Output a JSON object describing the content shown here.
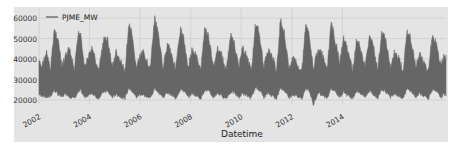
{
  "chart_data": {
    "type": "area",
    "title": "",
    "xlabel": "Datetime",
    "ylabel": "",
    "legend": {
      "position": "upper left",
      "entries": [
        "PJME_MW"
      ]
    },
    "grid": true,
    "ylim": [
      17000,
      62000
    ],
    "xlim": [
      2002.0,
      2018.1
    ],
    "yticks": [
      20000,
      30000,
      40000,
      50000,
      60000
    ],
    "ytick_labels": [
      "20000",
      "30000",
      "40000",
      "50000",
      "60000"
    ],
    "xticks": [
      2002,
      2004,
      2006,
      2008,
      2010,
      2012,
      2014
    ],
    "xtick_labels": [
      "2002",
      "2004",
      "2006",
      "2008",
      "2010",
      "2012",
      "2014"
    ],
    "series": [
      {
        "name": "PJME_MW",
        "color": "#666666",
        "baseline_min": 20000,
        "seasonal_points": [
          {
            "x": 2002.0,
            "max": 40000,
            "min": 22000
          },
          {
            "x": 2002.1,
            "max": 38000,
            "min": 21500
          },
          {
            "x": 2002.3,
            "max": 45000,
            "min": 20500
          },
          {
            "x": 2002.45,
            "max": 36000,
            "min": 21000
          },
          {
            "x": 2002.6,
            "max": 56000,
            "min": 24000
          },
          {
            "x": 2002.75,
            "max": 52000,
            "min": 22000
          },
          {
            "x": 2002.9,
            "max": 38000,
            "min": 20500
          },
          {
            "x": 2003.05,
            "max": 43000,
            "min": 22500
          },
          {
            "x": 2003.2,
            "max": 47000,
            "min": 21000
          },
          {
            "x": 2003.4,
            "max": 36000,
            "min": 20000
          },
          {
            "x": 2003.55,
            "max": 54000,
            "min": 23000
          },
          {
            "x": 2003.65,
            "max": 54500,
            "min": 24000
          },
          {
            "x": 2003.8,
            "max": 38000,
            "min": 20500
          },
          {
            "x": 2004.0,
            "max": 44000,
            "min": 22000
          },
          {
            "x": 2004.1,
            "max": 47000,
            "min": 22500
          },
          {
            "x": 2004.35,
            "max": 36000,
            "min": 20000
          },
          {
            "x": 2004.55,
            "max": 51000,
            "min": 23000
          },
          {
            "x": 2004.7,
            "max": 52000,
            "min": 23500
          },
          {
            "x": 2004.9,
            "max": 38000,
            "min": 20500
          },
          {
            "x": 2005.05,
            "max": 45000,
            "min": 22000
          },
          {
            "x": 2005.2,
            "max": 41000,
            "min": 21000
          },
          {
            "x": 2005.4,
            "max": 36000,
            "min": 20000
          },
          {
            "x": 2005.55,
            "max": 58000,
            "min": 25000
          },
          {
            "x": 2005.65,
            "max": 55000,
            "min": 24000
          },
          {
            "x": 2005.85,
            "max": 38000,
            "min": 20500
          },
          {
            "x": 2006.0,
            "max": 43000,
            "min": 22000
          },
          {
            "x": 2006.15,
            "max": 45000,
            "min": 21500
          },
          {
            "x": 2006.4,
            "max": 37000,
            "min": 20000
          },
          {
            "x": 2006.58,
            "max": 62000,
            "min": 25000
          },
          {
            "x": 2006.7,
            "max": 55000,
            "min": 23500
          },
          {
            "x": 2006.9,
            "max": 38000,
            "min": 20500
          },
          {
            "x": 2007.1,
            "max": 50000,
            "min": 23000
          },
          {
            "x": 2007.25,
            "max": 44000,
            "min": 21500
          },
          {
            "x": 2007.4,
            "max": 37000,
            "min": 20000
          },
          {
            "x": 2007.6,
            "max": 56000,
            "min": 24500
          },
          {
            "x": 2007.7,
            "max": 53000,
            "min": 24000
          },
          {
            "x": 2007.9,
            "max": 38000,
            "min": 20500
          },
          {
            "x": 2008.05,
            "max": 46000,
            "min": 22500
          },
          {
            "x": 2008.2,
            "max": 44000,
            "min": 21500
          },
          {
            "x": 2008.4,
            "max": 36000,
            "min": 20000
          },
          {
            "x": 2008.55,
            "max": 57000,
            "min": 24000
          },
          {
            "x": 2008.7,
            "max": 53000,
            "min": 23500
          },
          {
            "x": 2008.9,
            "max": 38000,
            "min": 20500
          },
          {
            "x": 2009.05,
            "max": 47000,
            "min": 22500
          },
          {
            "x": 2009.2,
            "max": 45000,
            "min": 21500
          },
          {
            "x": 2009.4,
            "max": 36000,
            "min": 20000
          },
          {
            "x": 2009.58,
            "max": 53000,
            "min": 23000
          },
          {
            "x": 2009.7,
            "max": 51000,
            "min": 23000
          },
          {
            "x": 2009.9,
            "max": 38000,
            "min": 20500
          },
          {
            "x": 2010.05,
            "max": 47000,
            "min": 22500
          },
          {
            "x": 2010.2,
            "max": 44000,
            "min": 21500
          },
          {
            "x": 2010.4,
            "max": 36000,
            "min": 20000
          },
          {
            "x": 2010.55,
            "max": 57000,
            "min": 25000
          },
          {
            "x": 2010.7,
            "max": 56000,
            "min": 24500
          },
          {
            "x": 2010.9,
            "max": 38000,
            "min": 20500
          },
          {
            "x": 2011.05,
            "max": 46000,
            "min": 22500
          },
          {
            "x": 2011.2,
            "max": 44000,
            "min": 21500
          },
          {
            "x": 2011.4,
            "max": 36000,
            "min": 20000
          },
          {
            "x": 2011.55,
            "max": 61000,
            "min": 25000
          },
          {
            "x": 2011.7,
            "max": 55000,
            "min": 24000
          },
          {
            "x": 2011.9,
            "max": 37000,
            "min": 20500
          },
          {
            "x": 2012.05,
            "max": 42000,
            "min": 22000
          },
          {
            "x": 2012.2,
            "max": 40000,
            "min": 21000
          },
          {
            "x": 2012.4,
            "max": 36000,
            "min": 20000
          },
          {
            "x": 2012.55,
            "max": 59000,
            "min": 25000
          },
          {
            "x": 2012.68,
            "max": 55000,
            "min": 24000
          },
          {
            "x": 2012.85,
            "max": 37000,
            "min": 17000
          },
          {
            "x": 2013.05,
            "max": 47000,
            "min": 22500
          },
          {
            "x": 2013.2,
            "max": 44000,
            "min": 21500
          },
          {
            "x": 2013.4,
            "max": 36000,
            "min": 20000
          },
          {
            "x": 2013.55,
            "max": 59000,
            "min": 25000
          },
          {
            "x": 2013.65,
            "max": 55000,
            "min": 24000
          },
          {
            "x": 2013.9,
            "max": 40000,
            "min": 20500
          },
          {
            "x": 2014.05,
            "max": 52000,
            "min": 23500
          },
          {
            "x": 2014.2,
            "max": 47000,
            "min": 21500
          },
          {
            "x": 2014.4,
            "max": 36000,
            "min": 20000
          },
          {
            "x": 2014.55,
            "max": 50000,
            "min": 23500
          },
          {
            "x": 2014.68,
            "max": 49000,
            "min": 23000
          },
          {
            "x": 2014.9,
            "max": 38000,
            "min": 20500
          },
          {
            "x": 2015.1,
            "max": 54000,
            "min": 24000
          },
          {
            "x": 2015.25,
            "max": 47000,
            "min": 21500
          },
          {
            "x": 2015.4,
            "max": 36000,
            "min": 20000
          },
          {
            "x": 2015.55,
            "max": 55000,
            "min": 24500
          },
          {
            "x": 2015.7,
            "max": 52000,
            "min": 23500
          },
          {
            "x": 2015.9,
            "max": 37000,
            "min": 20500
          },
          {
            "x": 2016.05,
            "max": 45000,
            "min": 22500
          },
          {
            "x": 2016.2,
            "max": 43000,
            "min": 21500
          },
          {
            "x": 2016.4,
            "max": 36000,
            "min": 20000
          },
          {
            "x": 2016.55,
            "max": 55000,
            "min": 24500
          },
          {
            "x": 2016.68,
            "max": 53000,
            "min": 24000
          },
          {
            "x": 2016.9,
            "max": 38000,
            "min": 20500
          },
          {
            "x": 2017.05,
            "max": 44000,
            "min": 22500
          },
          {
            "x": 2017.2,
            "max": 41000,
            "min": 21500
          },
          {
            "x": 2017.4,
            "max": 36000,
            "min": 20000
          },
          {
            "x": 2017.55,
            "max": 53000,
            "min": 24000
          },
          {
            "x": 2017.7,
            "max": 50000,
            "min": 23500
          },
          {
            "x": 2017.9,
            "max": 38000,
            "min": 20500
          },
          {
            "x": 2018.0,
            "max": 43000,
            "min": 22000
          },
          {
            "x": 2018.1,
            "max": 42000,
            "min": 22000
          }
        ]
      }
    ]
  },
  "colors": {
    "figure_bg": "#e4e4e4",
    "grid": "#c8c8c8",
    "series": "#666666",
    "text": "#333333"
  }
}
